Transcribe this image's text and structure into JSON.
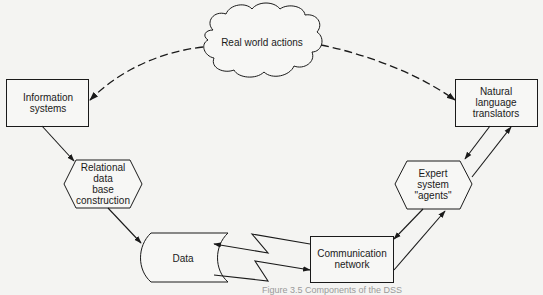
{
  "diagram": {
    "nodes": {
      "real_world": {
        "shape": "cloud",
        "label": "Real world actions"
      },
      "info_systems": {
        "shape": "rectangle",
        "line1": "Information",
        "line2": "systems"
      },
      "nl_translators": {
        "shape": "rectangle",
        "line1": "Natural",
        "line2": "language",
        "line3": "translators"
      },
      "relational_db": {
        "shape": "hexagon",
        "line1": "Relational",
        "line2": "data",
        "line3": "base",
        "line4": "construction"
      },
      "expert_system": {
        "shape": "hexagon",
        "line1": "Expert",
        "line2": "system",
        "line3": "\"agents\""
      },
      "data": {
        "shape": "storage",
        "label": "Data"
      },
      "comm_network": {
        "shape": "rectangle",
        "line1": "Communication",
        "line2": "network"
      }
    },
    "edges": [
      {
        "from": "Real world actions",
        "to": "Information systems",
        "style": "dashed"
      },
      {
        "from": "Real world actions",
        "to": "Natural language translators",
        "style": "dashed"
      },
      {
        "from": "Information systems",
        "to": "Relational data base construction",
        "style": "solid"
      },
      {
        "from": "Relational data base construction",
        "to": "Data",
        "style": "solid"
      },
      {
        "from": "Communication network",
        "to": "Data",
        "style": "lightning"
      },
      {
        "from": "Data",
        "to": "Communication network",
        "style": "lightning"
      },
      {
        "from": "Communication network",
        "to": "Expert system \"agents\"",
        "style": "solid"
      },
      {
        "from": "Expert system \"agents\"",
        "to": "Communication network",
        "style": "solid"
      },
      {
        "from": "Expert system \"agents\"",
        "to": "Natural language translators",
        "style": "solid"
      },
      {
        "from": "Natural language translators",
        "to": "Expert system \"agents\"",
        "style": "solid"
      }
    ],
    "caption": "Figure 3.5  Components of the DSS"
  },
  "colors": {
    "ink": "#1a1a1a",
    "background": "#f4f4f2",
    "fill": "#f7f7f5"
  }
}
